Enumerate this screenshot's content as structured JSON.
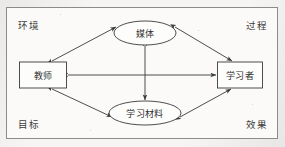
{
  "diagram": {
    "frame": {
      "border_color": "#8b8b8b",
      "background": "#fbfaf9"
    },
    "corner_labels": [
      {
        "name": "environment",
        "text": "环境",
        "position": "top-left"
      },
      {
        "name": "process",
        "text": "过程",
        "position": "top-right"
      },
      {
        "name": "goals",
        "text": "目标",
        "position": "bottom-left"
      },
      {
        "name": "effects",
        "text": "效果",
        "position": "bottom-right"
      }
    ],
    "nodes": [
      {
        "id": "media",
        "text": "媒体",
        "shape": "ellipse",
        "cx": 145,
        "cy": 33,
        "rx": 31,
        "ry": 12
      },
      {
        "id": "teacher",
        "text": "教师",
        "shape": "rectangle",
        "cx": 43,
        "cy": 75,
        "w": 47,
        "h": 26
      },
      {
        "id": "learner",
        "text": "学习者",
        "shape": "rectangle",
        "cx": 240,
        "cy": 75,
        "w": 45,
        "h": 26
      },
      {
        "id": "materials",
        "text": "学习材料",
        "shape": "ellipse",
        "cx": 145,
        "cy": 113,
        "rx": 36,
        "ry": 12
      }
    ],
    "edges": [
      {
        "from": "teacher",
        "to": "media",
        "arrow": "double"
      },
      {
        "from": "media",
        "to": "learner",
        "arrow": "double"
      },
      {
        "from": "teacher",
        "to": "materials",
        "arrow": "double"
      },
      {
        "from": "materials",
        "to": "learner",
        "arrow": "double"
      },
      {
        "from": "teacher",
        "to": "learner",
        "arrow": "double"
      },
      {
        "from": "media",
        "to": "materials",
        "arrow": "double"
      }
    ],
    "stroke_color": "#3a3a3a",
    "node_fill": "#fdfdfc"
  }
}
